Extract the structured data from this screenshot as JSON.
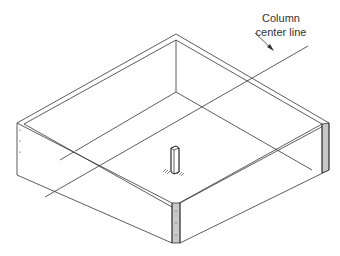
{
  "diagram": {
    "type": "isometric-technical-drawing",
    "callout": {
      "line1": "Column",
      "line2": "center line"
    },
    "elements": [
      "box-frame",
      "column-post",
      "column-center-line",
      "leader-arrow"
    ],
    "colors": {
      "line": "#333333",
      "end-grain-shade": "#c8c8c8",
      "background": "#ffffff"
    }
  }
}
